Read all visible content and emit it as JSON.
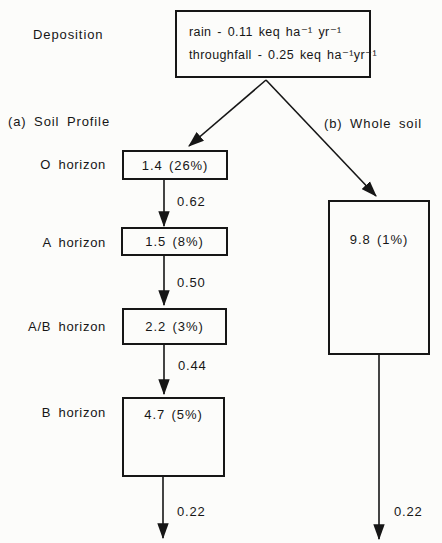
{
  "title": "Deposition",
  "deposition_box": {
    "rain_line": "rain - 0.11 keq ha⁻¹ yr⁻¹",
    "throughfall_line": "throughfall - 0.25 keq ha⁻¹yr⁻¹"
  },
  "sections": {
    "a_label": "(a) Soil Profile",
    "b_label": "(b) Whole soil"
  },
  "soil_profile": {
    "horizons": [
      {
        "label": "O horizon",
        "value": "1.4 (26%)",
        "outflow": "0.62"
      },
      {
        "label": "A horizon",
        "value": "1.5 (8%)",
        "outflow": "0.50"
      },
      {
        "label": "A/B horizon",
        "value": "2.2 (3%)",
        "outflow": "0.44"
      },
      {
        "label": "B horizon",
        "value": "4.7 (5%)",
        "outflow": "0.22"
      }
    ]
  },
  "whole_soil": {
    "value": "9.8 (1%)",
    "outflow": "0.22"
  },
  "colors": {
    "ink": "#161616",
    "paper": "#fcfcfa"
  }
}
